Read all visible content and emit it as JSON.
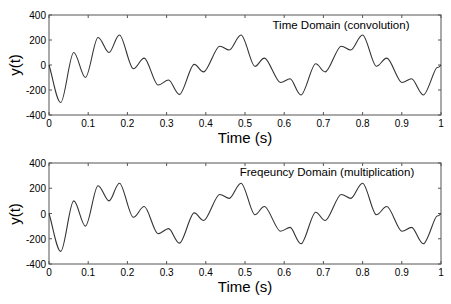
{
  "chart_data": [
    {
      "type": "line",
      "title": "Time Domain (convolution)",
      "xlabel": "Time (s)",
      "ylabel": "y(t)",
      "xlim": [
        0,
        1
      ],
      "ylim": [
        -400,
        400
      ],
      "xticks": [
        "0",
        "0.1",
        "0.2",
        "0.3",
        "0.4",
        "0.5",
        "0.6",
        "0.7",
        "0.8",
        "0.9",
        "1"
      ],
      "yticks": [
        "400",
        "200",
        "0",
        "-200",
        "-400"
      ],
      "grid": false,
      "legend": null,
      "series": [
        {
          "name": "y(t)",
          "color": "#333333",
          "x": [
            0,
            0.03,
            0.063,
            0.093,
            0.125,
            0.153,
            0.18,
            0.215,
            0.243,
            0.278,
            0.305,
            0.333,
            0.37,
            0.395,
            0.435,
            0.46,
            0.49,
            0.525,
            0.55,
            0.59,
            0.615,
            0.643,
            0.68,
            0.705,
            0.745,
            0.77,
            0.8,
            0.835,
            0.862,
            0.9,
            0.925,
            0.955,
            0.99,
            1
          ],
          "y": [
            0,
            -300,
            100,
            -100,
            220,
            100,
            240,
            -30,
            55,
            -160,
            -120,
            -235,
            5,
            -55,
            150,
            120,
            240,
            -10,
            55,
            -140,
            -110,
            -240,
            10,
            -55,
            150,
            120,
            240,
            -10,
            55,
            -140,
            -110,
            -240,
            -20,
            0
          ]
        }
      ]
    },
    {
      "type": "line",
      "title": "Freqeuncy Domain (multiplication)",
      "xlabel": "Time (s)",
      "ylabel": "y(t)",
      "xlim": [
        0,
        1
      ],
      "ylim": [
        -400,
        400
      ],
      "xticks": [
        "0",
        "0.1",
        "0.2",
        "0.3",
        "0.4",
        "0.5",
        "0.6",
        "0.7",
        "0.8",
        "0.9",
        "1"
      ],
      "yticks": [
        "400",
        "200",
        "0",
        "-200",
        "-400"
      ],
      "grid": false,
      "legend": null,
      "series": [
        {
          "name": "y(t)",
          "color": "#333333",
          "x": [
            0,
            0.03,
            0.063,
            0.093,
            0.125,
            0.153,
            0.18,
            0.215,
            0.243,
            0.278,
            0.305,
            0.333,
            0.37,
            0.395,
            0.435,
            0.46,
            0.49,
            0.525,
            0.55,
            0.59,
            0.615,
            0.643,
            0.68,
            0.705,
            0.745,
            0.77,
            0.8,
            0.835,
            0.862,
            0.9,
            0.925,
            0.955,
            0.99,
            1
          ],
          "y": [
            0,
            -300,
            100,
            -100,
            220,
            100,
            240,
            -30,
            55,
            -160,
            -120,
            -235,
            5,
            -55,
            150,
            120,
            240,
            -10,
            55,
            -140,
            -110,
            -240,
            10,
            -55,
            150,
            120,
            240,
            -10,
            55,
            -140,
            -110,
            -240,
            -20,
            0
          ]
        }
      ]
    }
  ],
  "plots": [
    {
      "title": "Time Domain (convolution)",
      "xlabel": "Time (s)",
      "ylabel": "y(t)",
      "xticks": [
        "0",
        "0.1",
        "0.2",
        "0.3",
        "0.4",
        "0.5",
        "0.6",
        "0.7",
        "0.8",
        "0.9",
        "1"
      ],
      "yticks": [
        "400",
        "200",
        "0",
        "-200",
        "-400"
      ]
    },
    {
      "title": "Freqeuncy Domain (multiplication)",
      "xlabel": "Time (s)",
      "ylabel": "y(t)",
      "xticks": [
        "0",
        "0.1",
        "0.2",
        "0.3",
        "0.4",
        "0.5",
        "0.6",
        "0.7",
        "0.8",
        "0.9",
        "1"
      ],
      "yticks": [
        "400",
        "200",
        "0",
        "-200",
        "-400"
      ]
    }
  ]
}
